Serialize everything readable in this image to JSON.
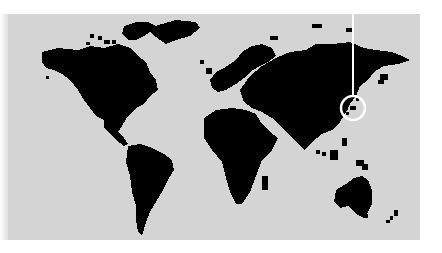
{
  "map": {
    "type": "world-map",
    "style": "pixelated-silhouette",
    "background_color": "#d4d4d4",
    "land_color": "#000000",
    "marker": {
      "label": "",
      "region": "Japan",
      "shape": "circle",
      "color": "#ffffff",
      "cx": 353,
      "cy": 108,
      "r": 12
    },
    "continents": [
      "North America",
      "Greenland",
      "South America",
      "Europe",
      "Africa",
      "Asia",
      "Australia",
      "New Zealand"
    ]
  }
}
